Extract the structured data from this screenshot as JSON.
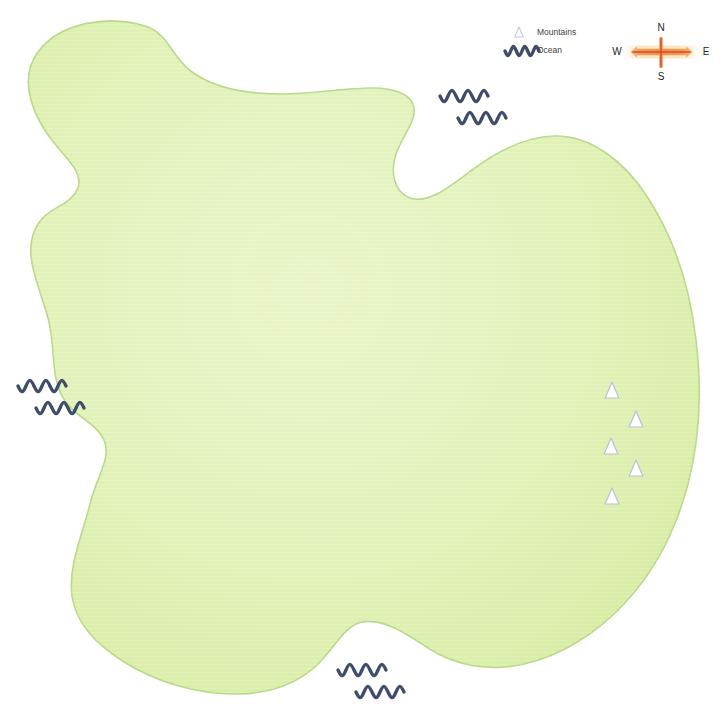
{
  "document": {
    "type": "illustrated-island-map",
    "width": 723,
    "height": 727,
    "background_color": "#ffffff",
    "clipped_header_text": ""
  },
  "colors": {
    "land_fill_light": "#e6f4c4",
    "land_fill_mid": "#dcefa8",
    "land_fill_edge": "#d4ea99",
    "land_stroke": "#b9d98a",
    "ocean_wave": "#3f4d6b",
    "mountain_stroke": "#b9c2d4",
    "mountain_fill": "#ffffff",
    "legend_icon_stroke": "#c3cad8",
    "legend_text": "#3f3f3f",
    "compass_bar": "#f0a868",
    "compass_core": "#d9453c",
    "compass_glow": "#f7d9a8",
    "compass_text": "#262626"
  },
  "legend": {
    "name": "Map Legend",
    "items": [
      {
        "id": "mountains",
        "label": "Mountains",
        "icon": "triangle-outline-icon",
        "x": 519,
        "y": 32
      },
      {
        "id": "ocean",
        "label": "Ocean",
        "icon": "wave-line-icon",
        "x": 519,
        "y": 51
      }
    ],
    "label_x": 537
  },
  "compass": {
    "name": "Compass Rose",
    "center_x": 661,
    "center_y": 52,
    "directions": {
      "north": "N",
      "south": "S",
      "east": "E",
      "west": "W"
    },
    "north_x": 661,
    "north_y": 28,
    "south_x": 661,
    "south_y": 77,
    "west_x": 617,
    "west_y": 52,
    "east_x": 706,
    "east_y": 52,
    "bar_left": 630,
    "bar_right": 693,
    "cross_top": 37,
    "cross_bottom": 68
  },
  "island": {
    "name": "Main Landmass",
    "path": "M 148,27 C 110,14 60,22 38,52 C 20,76 30,108 46,132 C 62,156 84,170 78,188 C 70,208 44,206 34,232 C 24,258 40,288 48,318 C 56,348 50,372 62,396 C 72,416 96,422 104,440 C 112,458 96,478 90,504 C 82,536 68,566 72,596 C 76,624 96,644 124,662 C 156,682 196,694 236,694 C 272,694 300,682 318,664 C 336,646 344,626 362,622 C 382,618 404,632 428,648 C 456,666 490,672 524,664 C 560,656 596,634 624,604 C 654,572 676,530 688,484 C 700,438 702,390 696,340 C 690,288 674,238 648,198 C 624,160 590,136 556,136 C 524,136 496,152 472,170 C 448,188 428,204 410,198 C 394,192 390,172 396,154 C 402,136 416,122 414,108 C 412,94 394,88 372,88 C 346,88 312,94 280,94 C 246,94 214,88 192,72 C 172,58 170,36 148,27 Z",
    "texture_opacity": 0.5
  },
  "mountains": {
    "name": "Mountain Range Markers",
    "count": 5,
    "markers": [
      {
        "id": "mtn-1",
        "x": 612,
        "y": 390,
        "size": 16
      },
      {
        "id": "mtn-2",
        "x": 636,
        "y": 419,
        "size": 16
      },
      {
        "id": "mtn-3",
        "x": 611,
        "y": 446,
        "size": 16
      },
      {
        "id": "mtn-4",
        "x": 636,
        "y": 468,
        "size": 16
      },
      {
        "id": "mtn-5",
        "x": 612,
        "y": 496,
        "size": 16
      }
    ]
  },
  "ocean_markers": {
    "name": "Ocean Wave Markers",
    "count": 4,
    "groups": [
      {
        "id": "ocean-north",
        "label": "northern sea",
        "x": 440,
        "y": 96,
        "offset_x": 18,
        "offset_y": 22
      },
      {
        "id": "ocean-west",
        "label": "western sea",
        "x": 18,
        "y": 386,
        "offset_x": 18,
        "offset_y": 22
      },
      {
        "id": "ocean-south",
        "label": "southern sea",
        "x": 338,
        "y": 670,
        "offset_x": 18,
        "offset_y": 22
      },
      {
        "id": "ocean-southeast",
        "label": "southeastern sea",
        "x": 0,
        "y": 0,
        "offset_x": 0,
        "offset_y": 0
      }
    ],
    "wave_width": 48,
    "wave_amplitude": 5
  }
}
